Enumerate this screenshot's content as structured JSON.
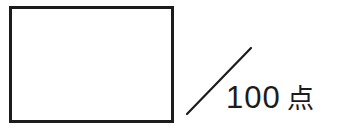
{
  "answer_box": {
    "value": ""
  },
  "score": {
    "max_points": "100",
    "unit": "点"
  },
  "colors": {
    "ink": "#1c1c1c",
    "background": "#ffffff"
  }
}
